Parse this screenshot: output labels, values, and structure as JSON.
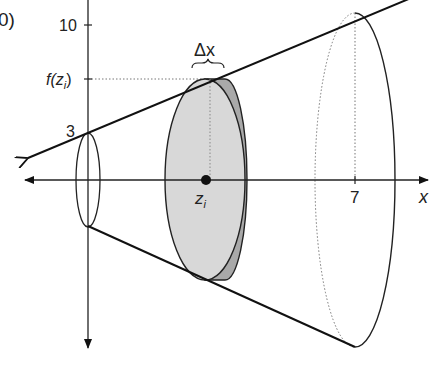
{
  "figure": {
    "type": "volume-of-revolution-diagram",
    "labels": {
      "top_left_fragment": "0)",
      "y_tick_10": "10",
      "y_tick_fzi": "f(z",
      "y_tick_fzi_sub": "i",
      "y_tick_fzi_close": ")",
      "y_intercept": "3",
      "delta_x": "Δx",
      "zi": "z",
      "zi_sub": "i",
      "x_tick_7": "7",
      "x_axis": "x",
      "left_fragment": "<"
    },
    "values": {
      "y_intercept": 3,
      "y_tick": 10,
      "x_tick": 7
    },
    "colors": {
      "line": "#111111",
      "disk_front": "#d6d6d6",
      "disk_back": "#a9a9a9",
      "dotted": "#777777"
    }
  }
}
